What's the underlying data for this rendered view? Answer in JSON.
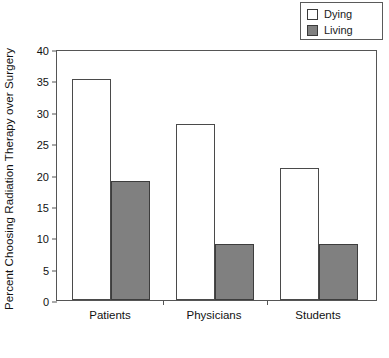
{
  "chart_data": {
    "type": "bar",
    "title": "",
    "xlabel": "",
    "ylabel": "Percent Choosing Radiation Therapy over Surgery",
    "categories": [
      "Patients",
      "Physicians",
      "Students"
    ],
    "series": [
      {
        "name": "Dying",
        "values": [
          35.2,
          28,
          21
        ],
        "color": "#ffffff"
      },
      {
        "name": "Living",
        "values": [
          19,
          9,
          9
        ],
        "color": "#808080"
      }
    ],
    "ylim": [
      0,
      40
    ],
    "ytick_values": [
      0,
      5,
      10,
      15,
      20,
      25,
      30,
      35,
      40
    ],
    "ytick_labels": [
      "0",
      "5",
      "10",
      "15",
      "20",
      "25",
      "30",
      "35",
      "40"
    ],
    "grid": false,
    "legend_position": "top-right"
  },
  "legend": {
    "entries": [
      {
        "label": "Dying",
        "swatch": "white-square-icon"
      },
      {
        "label": "Living",
        "swatch": "gray-square-icon"
      }
    ]
  }
}
